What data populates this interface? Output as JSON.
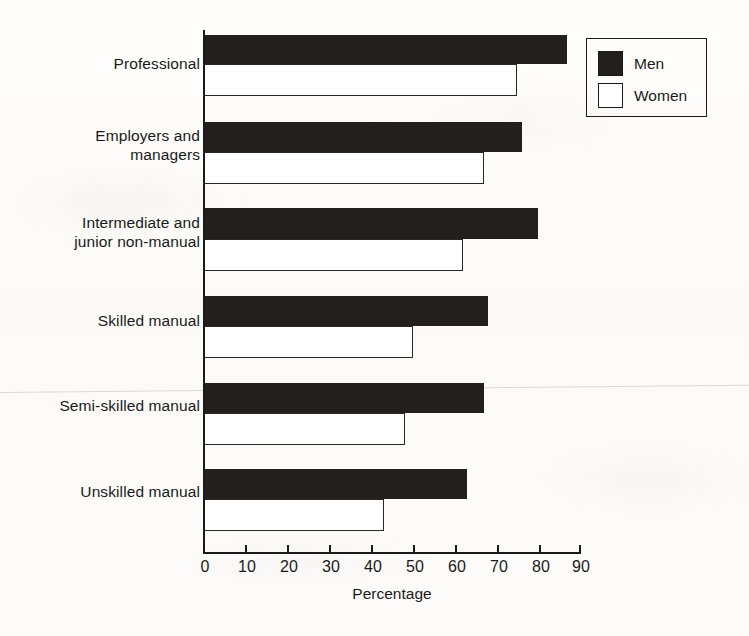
{
  "chart_data": {
    "type": "bar",
    "orientation": "horizontal",
    "title": "",
    "xlabel": "Percentage",
    "ylabel": "",
    "xlim": [
      0,
      90
    ],
    "xticks": [
      0,
      10,
      20,
      30,
      40,
      50,
      60,
      70,
      80,
      90
    ],
    "grid": false,
    "categories": [
      "Professional",
      "Employers and\nmanagers",
      "Intermediate and\njunior non-manual",
      "Skilled manual",
      "Semi-skilled manual",
      "Unskilled manual"
    ],
    "series": [
      {
        "name": "Men",
        "color": "#231f1c",
        "values": [
          87,
          76,
          80,
          68,
          67,
          63
        ]
      },
      {
        "name": "Women",
        "color": "#ffffff",
        "values": [
          75,
          67,
          62,
          50,
          48,
          43
        ]
      }
    ],
    "legend": {
      "position": "top-right",
      "entries": [
        {
          "label": "Men",
          "swatch": "filled-black"
        },
        {
          "label": "Women",
          "swatch": "outlined-white"
        }
      ]
    }
  },
  "axis": {
    "tick_labels": [
      "0",
      "10",
      "20",
      "30",
      "40",
      "50",
      "60",
      "70",
      "80",
      "90"
    ],
    "x_title": "Percentage"
  },
  "legend": {
    "men_label": "Men",
    "women_label": "Women"
  },
  "categories": {
    "c0": "Professional",
    "c1": "Employers and\nmanagers",
    "c2": "Intermediate and\njunior non-manual",
    "c3": "Skilled manual",
    "c4": "Semi-skilled manual",
    "c5": "Unskilled manual"
  },
  "colors": {
    "men": "#231f1c",
    "women": "#ffffff",
    "ink": "#1a1a1a",
    "paper": "#fdfcfa"
  }
}
